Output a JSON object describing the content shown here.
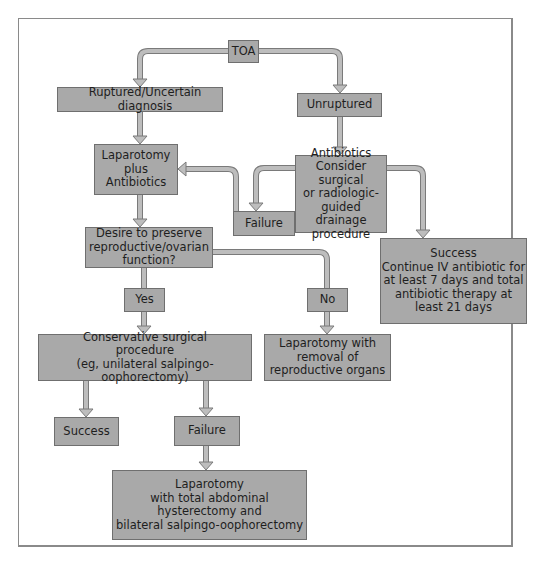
{
  "diagram": {
    "type": "flowchart",
    "colors": {
      "box_fill": "#a9a9a9",
      "box_border": "#6f6f6f",
      "arrow_fill": "#b8b8b8",
      "arrow_stroke": "#7a7a7a",
      "frame": "#8a8a8a",
      "background": "#ffffff"
    },
    "nodes": {
      "toa": "TOA",
      "ruptured": "Ruptured/Uncertain diagnosis",
      "unruptured": "Unruptured",
      "laparotomy_antibiotics": "Laparotomy\nplus\nAntibiotics",
      "antibiotics_drainage": "Antibiotics\nConsider surgical\nor radiologic-\nguided drainage\nprocedure",
      "failure_right": "Failure",
      "success_iv": "Success\nContinue IV antibiotic for\nat least 7 days and total\nantibiotic therapy at\nleast 21 days",
      "desire_preserve": "Desire to preserve\nreproductive/ovarian\nfunction?",
      "yes": "Yes",
      "no": "No",
      "conservative": "Conservative surgical\nprocedure\n(eg, unilateral salpingo-oophorectomy)",
      "laparotomy_removal": "Laparotomy with\nremoval of\nreproductive organs",
      "success_bottom": "Success",
      "failure_bottom": "Failure",
      "laparotomy_total": "Laparotomy\nwith total abdominal\nhysterectomy and\nbilateral salpingo-oophorectomy"
    },
    "edges": [
      {
        "from": "toa",
        "to": "ruptured"
      },
      {
        "from": "toa",
        "to": "unruptured"
      },
      {
        "from": "ruptured",
        "to": "laparotomy_antibiotics"
      },
      {
        "from": "unruptured",
        "to": "antibiotics_drainage"
      },
      {
        "from": "antibiotics_drainage",
        "to": "failure_right"
      },
      {
        "from": "antibiotics_drainage",
        "to": "success_iv"
      },
      {
        "from": "failure_right",
        "to": "laparotomy_antibiotics"
      },
      {
        "from": "laparotomy_antibiotics",
        "to": "desire_preserve"
      },
      {
        "from": "desire_preserve",
        "to": "yes"
      },
      {
        "from": "desire_preserve",
        "to": "no"
      },
      {
        "from": "yes",
        "to": "conservative"
      },
      {
        "from": "no",
        "to": "laparotomy_removal"
      },
      {
        "from": "conservative",
        "to": "success_bottom"
      },
      {
        "from": "conservative",
        "to": "failure_bottom"
      },
      {
        "from": "failure_bottom",
        "to": "laparotomy_total"
      }
    ]
  }
}
